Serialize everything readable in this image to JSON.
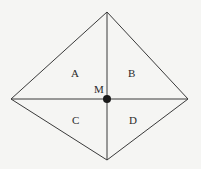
{
  "diagram": {
    "type": "rhombus-divided-into-four-regions",
    "vertices": {
      "top": [
        107,
        12
      ],
      "right": [
        188,
        99
      ],
      "bottom": [
        107,
        160
      ],
      "left": [
        11,
        99
      ]
    },
    "center": {
      "label": "M",
      "point": [
        107,
        99
      ]
    },
    "regions": [
      {
        "label": "A",
        "position": "upper-left"
      },
      {
        "label": "B",
        "position": "upper-right"
      },
      {
        "label": "C",
        "position": "lower-left"
      },
      {
        "label": "D",
        "position": "lower-right"
      }
    ],
    "colors": {
      "line": "#3a3a3a",
      "dot": "#1a1a1a",
      "background": "#f5f5f3"
    }
  }
}
